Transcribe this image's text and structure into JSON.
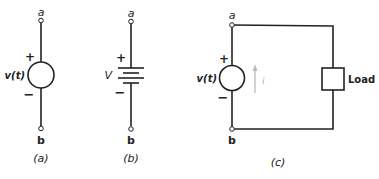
{
  "figure_a": {
    "caption": "(a)",
    "terminal_top": "a",
    "terminal_bottom": "b",
    "source_label": "v(t)",
    "plus": "+",
    "minus": "−",
    "element": "independent voltage source"
  },
  "figure_b": {
    "caption": "(b)",
    "terminal_top": "a",
    "terminal_bottom": "b",
    "source_label": "V",
    "plus": "+",
    "minus": "−",
    "element": "battery (dc voltage source)"
  },
  "figure_c": {
    "caption": "(c)",
    "terminal_top": "a",
    "terminal_bottom": "b",
    "source_label": "v(t)",
    "plus": "+",
    "minus": "−",
    "current_label": "i",
    "load_label": "Load",
    "element": "voltage source connected to load"
  },
  "colors": {
    "line": "#222222",
    "current_arrow": "#bbbbbb"
  }
}
